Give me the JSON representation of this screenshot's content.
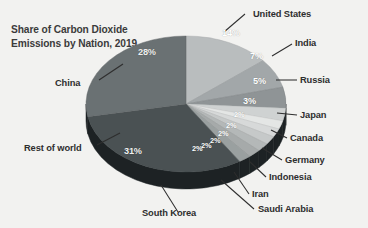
{
  "chart_title_line1": "Share of Carbon Dioxide",
  "chart_title_line2": "Emissions by Nation, 2019",
  "chart_data": {
    "type": "pie",
    "title": "Share of Carbon Dioxide Emissions by Nation, 2019",
    "xlabel": "",
    "ylabel": "",
    "grid": false,
    "legend": "callout-labels",
    "units": "percent",
    "categories": [
      "United States",
      "India",
      "Russia",
      "Japan",
      "Canada",
      "Germany",
      "Indonesia",
      "Iran",
      "Saudi Arabia",
      "South Korea",
      "Rest of world",
      "China"
    ],
    "values": [
      14,
      7,
      5,
      3,
      2,
      2,
      2,
      2,
      2,
      2,
      31,
      28
    ],
    "labels": [
      "14%",
      "7%",
      "5%",
      "3%",
      "2%",
      "2%",
      "2%",
      "2%",
      "2%",
      "2%",
      "31%",
      "28%"
    ],
    "colors": [
      "#b9bdbe",
      "#a2a7a9",
      "#8f9496",
      "#cfd2d2",
      "#e4e6e5",
      "#d7d9d9",
      "#c6c9c9",
      "#b4b8b8",
      "#a6aaaa",
      "#9aa0a0",
      "#4a5153",
      "#6a7173"
    ],
    "slices": [
      {
        "name": "United States",
        "value": 14,
        "label": "14%",
        "color": "#b9bdbe"
      },
      {
        "name": "India",
        "value": 7,
        "label": "7%",
        "color": "#a2a7a9"
      },
      {
        "name": "Russia",
        "value": 5,
        "label": "5%",
        "color": "#8f9496"
      },
      {
        "name": "Japan",
        "value": 3,
        "label": "3%",
        "color": "#cfd2d2"
      },
      {
        "name": "Canada",
        "value": 2,
        "label": "2%",
        "color": "#e4e6e5"
      },
      {
        "name": "Germany",
        "value": 2,
        "label": "2%",
        "color": "#d7d9d9"
      },
      {
        "name": "Indonesia",
        "value": 2,
        "label": "2%",
        "color": "#c6c9c9"
      },
      {
        "name": "Iran",
        "value": 2,
        "label": "2%",
        "color": "#b4b8b8"
      },
      {
        "name": "Saudi Arabia",
        "value": 2,
        "label": "2%",
        "color": "#a6aaaa"
      },
      {
        "name": "South Korea",
        "value": 2,
        "label": "2%",
        "color": "#9aa0a0"
      },
      {
        "name": "Rest of world",
        "value": 31,
        "label": "31%",
        "color": "#4a5153"
      },
      {
        "name": "China",
        "value": 28,
        "label": "28%",
        "color": "#6a7173"
      }
    ]
  },
  "callouts": {
    "united_states": "United States",
    "india": "India",
    "russia": "Russia",
    "japan": "Japan",
    "canada": "Canada",
    "germany": "Germany",
    "indonesia": "Indonesia",
    "iran": "Iran",
    "saudi_arabia": "Saudi Arabia",
    "south_korea": "South Korea",
    "rest_of_world": "Rest of world",
    "china": "China"
  },
  "pct": {
    "united_states": "14%",
    "india": "7%",
    "russia": "5%",
    "japan": "3%",
    "canada": "2%",
    "germany": "2%",
    "indonesia": "2%",
    "iran": "2%",
    "saudi_arabia": "2%",
    "south_korea": "2%",
    "rest_of_world": "31%",
    "china": "28%"
  },
  "theme": {
    "background": "#f2f2f0",
    "title_color": "#3b3b3b",
    "label_color": "#2e2e2e",
    "pie_side": "#1d2224",
    "leader_color": "#2e2e2e"
  }
}
